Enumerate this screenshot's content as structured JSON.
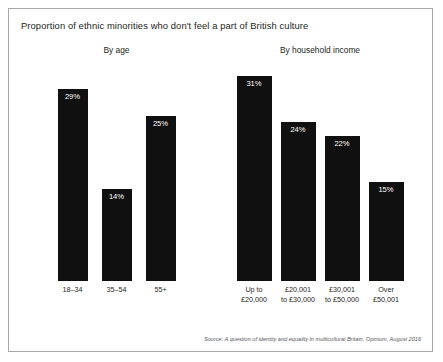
{
  "figure": {
    "title": "Proportion of ethnic minorities who don't feel a part of British culture",
    "source": "Source: A question of identity and equality in multicultural Britain, Opinium, August 2016",
    "bar_color": "#111010",
    "border_color": "#a7a9ac",
    "label_color": "#ffffff"
  },
  "panels": [
    {
      "key": "by-age",
      "title": "By age",
      "bar_width_px": 30,
      "gap_px": 14,
      "categories": [
        {
          "line1": "18–34",
          "line2": ""
        },
        {
          "line1": "35–54",
          "line2": ""
        },
        {
          "line1": "55+",
          "line2": ""
        }
      ],
      "values": [
        "29%",
        "14%",
        "25%"
      ]
    },
    {
      "key": "by-household-income",
      "title": "By household income",
      "bar_width_px": 35,
      "gap_px": 9,
      "categories": [
        {
          "line1": "Up to",
          "line2": "£20,000"
        },
        {
          "line1": "£20,001",
          "line2": "to £30,000"
        },
        {
          "line1": "£30,001",
          "line2": "to £50,000"
        },
        {
          "line1": "Over",
          "line2": "£50,001"
        }
      ],
      "values": [
        "31%",
        "24%",
        "22%",
        "15%"
      ]
    }
  ],
  "chart_data": {
    "type": "bar",
    "title": "Proportion of ethnic minorities who don't feel a part of British culture",
    "xlabel": "",
    "ylabel": "",
    "ylim": [
      0,
      33
    ],
    "grid": false,
    "legend": "none",
    "units": "percent",
    "annotations": [
      "Source: A question of identity and equality in multicultural Britain, Opinium, August 2016"
    ],
    "panels": [
      {
        "name": "By age",
        "categories": [
          "18–34",
          "35–54",
          "55+"
        ],
        "values": [
          29,
          14,
          25
        ]
      },
      {
        "name": "By household income",
        "categories": [
          "Up to £20,000",
          "£20,001 to £30,000",
          "£30,001 to £50,000",
          "Over £50,001"
        ],
        "values": [
          31,
          24,
          22,
          15
        ]
      }
    ]
  }
}
